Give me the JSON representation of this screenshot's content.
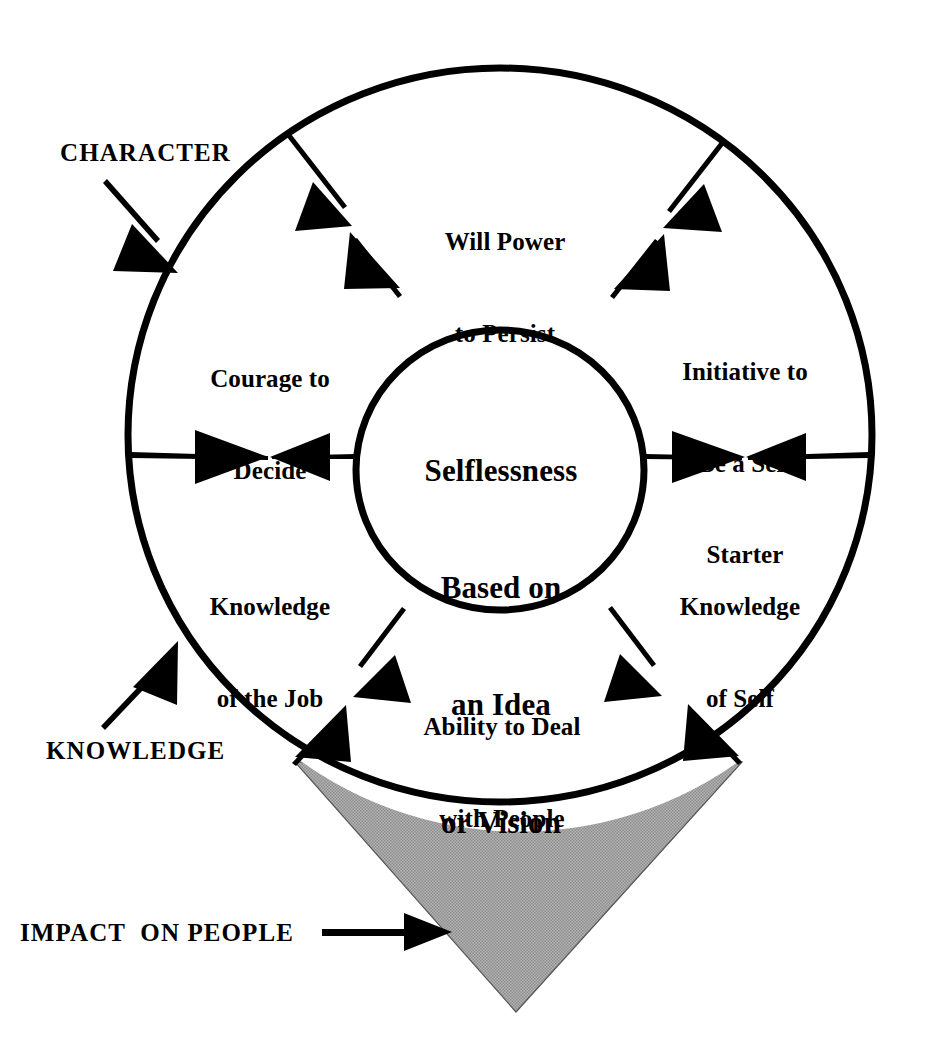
{
  "diagram": {
    "title_center": "Selflessness\nBased on\nan Idea\nor Vision",
    "center_lines": [
      "Selflessness",
      "Based on",
      "an Idea",
      "or Vision"
    ],
    "colors": {
      "stroke": "#000000",
      "background": "#ffffff",
      "triangle_fill": "#a8a8a8",
      "text": "#000000"
    },
    "outer_labels": [
      {
        "key": "character",
        "text": "CHARACTER",
        "arrow": "down-right-arrow-icon"
      },
      {
        "key": "knowledge",
        "text": "KNOWLEDGE",
        "arrow": "up-right-arrow-icon"
      },
      {
        "key": "impact",
        "text": "IMPACT  ON PEOPLE",
        "arrow": "right-arrow-icon"
      }
    ],
    "petals": [
      {
        "key": "will-power",
        "line1": "Will Power",
        "line2": "to Persist",
        "line3": ""
      },
      {
        "key": "initiative",
        "line1": "Initiative to",
        "line2": "Be a Self",
        "line3": "Starter"
      },
      {
        "key": "knowledge-of-self",
        "line1": "Knowledge",
        "line2": "of Self",
        "line3": ""
      },
      {
        "key": "ability",
        "line1": "Ability to Deal",
        "line2": "with People",
        "line3": ""
      },
      {
        "key": "knowledge-of-job",
        "line1": "Knowledge",
        "line2": "of the Job",
        "line3": ""
      },
      {
        "key": "courage",
        "line1": "Courage to",
        "line2": "Decide",
        "line3": ""
      }
    ],
    "connectors": [
      {
        "key": "upper-left",
        "type": "double-headed-arrow"
      },
      {
        "key": "upper-right",
        "type": "double-headed-arrow"
      },
      {
        "key": "left",
        "type": "double-headed-arrow"
      },
      {
        "key": "right",
        "type": "double-headed-arrow"
      },
      {
        "key": "lower-left",
        "type": "double-headed-arrow"
      },
      {
        "key": "lower-right",
        "type": "double-headed-arrow"
      }
    ],
    "shapes": {
      "outer_ellipse": {
        "cx": 500,
        "cy": 435,
        "rx": 372,
        "ry": 367
      },
      "inner_circle": {
        "cx": 500,
        "cy": 470,
        "rx": 144,
        "ry": 140
      },
      "triangle": {
        "label": "impact-triangle"
      }
    }
  }
}
